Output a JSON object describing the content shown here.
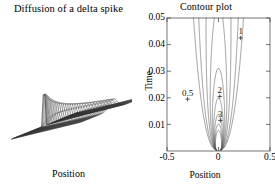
{
  "figure": {
    "background": "#ffffff",
    "line_color": "#3a3a3a",
    "text_color": "#000000"
  },
  "left_panel": {
    "title": "Diffusion of a delta spike",
    "xlabel": "Position",
    "plot_type": "surface-mesh"
  },
  "right_panel": {
    "title": "Contour plot",
    "xlabel": "Position",
    "ylabel": "Time"
  },
  "chart_data": [
    {
      "type": "surface",
      "title": "Diffusion of a delta spike",
      "xlabel": "Position",
      "ylabel": "",
      "zlabel": "",
      "description": "3D mesh surface of Gaussian spreading from a delta spike; tall narrow peak at early time decaying to a broad flat sheet at later time",
      "grid": false,
      "axes_visible": false,
      "x": [
        -0.5,
        0.5
      ],
      "y": [
        0.0,
        0.05
      ],
      "peak_position": 0.0,
      "peak_value": 1.0
    },
    {
      "type": "contour",
      "title": "Contour plot",
      "xlabel": "Position",
      "ylabel": "Time",
      "xlim": [
        -0.5,
        0.5
      ],
      "ylim": [
        0.0,
        0.05
      ],
      "xticks": [
        -0.5,
        0,
        0.5
      ],
      "xticklabels": [
        "-0.5",
        "0",
        "0.5"
      ],
      "yticks": [
        0.01,
        0.02,
        0.03,
        0.04,
        0.05
      ],
      "yticklabels": [
        "0.01",
        "0.02",
        "0.03",
        "0.04",
        "0.05"
      ],
      "grid": false,
      "legend": "none",
      "levels": [
        0.5,
        1,
        2,
        3,
        4,
        5,
        6,
        7,
        8
      ],
      "inline_labels": [
        {
          "text": "0.5",
          "x": -0.3,
          "y": 0.0195
        },
        {
          "text": "1",
          "x": 0.215,
          "y": 0.0425
        },
        {
          "text": "2",
          "x": 0.012,
          "y": 0.0205
        },
        {
          "text": "3",
          "x": 0.018,
          "y": 0.0115
        }
      ],
      "note": "Contours of a diffusing Gaussian u(x,t)=exp(-x^2/(4Dt))/sqrt(4 pi D t); contours open upward and converge to the origin spike at t=0"
    }
  ]
}
